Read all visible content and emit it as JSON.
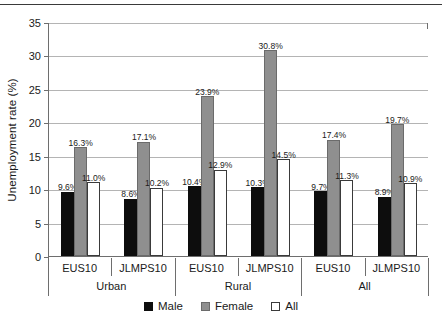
{
  "chart_data": {
    "type": "bar",
    "title": "",
    "xlabel": "",
    "ylabel": "Unemployment rate (%)",
    "ylim": [
      0,
      35
    ],
    "yticks": [
      0,
      5,
      10,
      15,
      20,
      25,
      30,
      35
    ],
    "ytick_labels": [
      "0",
      "5",
      "10",
      "15",
      "20",
      "25",
      "30",
      "35"
    ],
    "grid": true,
    "legend_position": "bottom",
    "value_label_suffix": "%",
    "categories": [
      "EUS10",
      "JLMPS10",
      "EUS10",
      "JLMPS10",
      "EUS10",
      "JLMPS10"
    ],
    "group_labels": [
      "Urban",
      "Rural",
      "All"
    ],
    "series": [
      {
        "name": "Male",
        "color": "#0d0d0d",
        "values": [
          9.6,
          8.6,
          10.4,
          10.3,
          9.7,
          8.9
        ]
      },
      {
        "name": "Female",
        "color": "#8f8f8f",
        "values": [
          16.3,
          17.1,
          23.9,
          30.8,
          17.4,
          19.7
        ]
      },
      {
        "name": "All",
        "color": "#ffffff",
        "values": [
          11.0,
          10.2,
          12.9,
          14.5,
          11.3,
          10.9
        ]
      }
    ],
    "data_labels": [
      [
        "9.6%",
        "16.3%",
        "11.0%"
      ],
      [
        "8.6%",
        "17.1%",
        "10.2%"
      ],
      [
        "10.4%",
        "23.9%",
        "12.9%"
      ],
      [
        "10.3%",
        "30.8%",
        "14.5%"
      ],
      [
        "9.7%",
        "17.4%",
        "11.3%"
      ],
      [
        "8.9%",
        "19.7%",
        "10.9%"
      ]
    ],
    "legend": [
      {
        "label": "Male",
        "swatch": "male"
      },
      {
        "label": "Female",
        "swatch": "female"
      },
      {
        "label": "All",
        "swatch": "all"
      }
    ]
  }
}
